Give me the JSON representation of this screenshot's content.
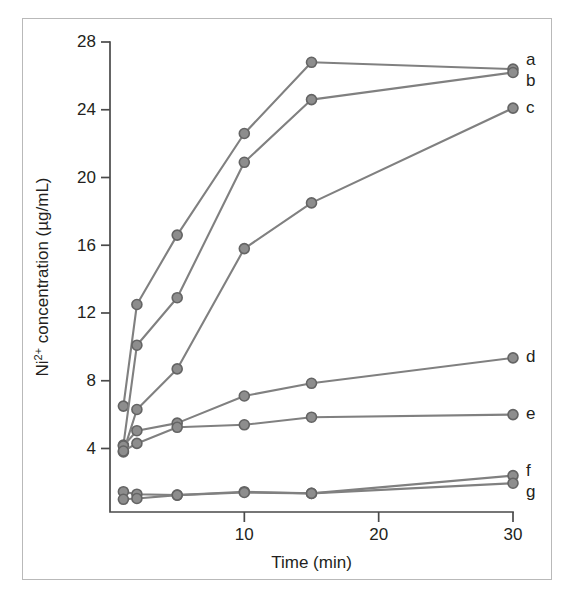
{
  "figure": {
    "background_color": "#ffffff",
    "border_color": "#b9b9b9",
    "axis_color": "#4a4a4a",
    "text_color": "#231f20"
  },
  "chart_data": {
    "type": "line",
    "title": "",
    "subtitle": "",
    "xlabel": "Time (min)",
    "ylabel": "Ni2+ concentration (µg/mL)",
    "ylabel_parts": {
      "prefix": "Ni",
      "superscript": "2+",
      "suffix": " concentration (µg/mL)"
    },
    "xlim": [
      0,
      31.5
    ],
    "ylim": [
      0,
      28.6
    ],
    "xticks": [
      10,
      20,
      30
    ],
    "xtick_labels": [
      "10",
      "20",
      "30"
    ],
    "yticks": [
      4,
      8,
      12,
      16,
      20,
      24,
      28
    ],
    "ytick_labels": [
      "4",
      "8",
      "12",
      "16",
      "20",
      "24",
      "28"
    ],
    "grid": false,
    "legend_position": "right-of-line-ends",
    "series_color": "#808080",
    "marker_fill": "#8d8d8d",
    "marker_edge": "#646464",
    "marker_radius": 5,
    "series": [
      {
        "name": "a",
        "label": "a",
        "color": "#808080",
        "x": [
          1,
          2,
          5,
          10,
          15,
          30
        ],
        "values": [
          6.5,
          12.5,
          16.6,
          22.6,
          26.8,
          26.4
        ]
      },
      {
        "name": "b",
        "label": "b",
        "color": "#808080",
        "x": [
          1,
          2,
          5,
          10,
          15,
          30
        ],
        "values": [
          4.2,
          10.1,
          12.9,
          20.9,
          24.6,
          26.2
        ]
      },
      {
        "name": "c",
        "label": "c",
        "color": "#808080",
        "x": [
          1,
          2,
          5,
          10,
          15,
          30
        ],
        "values": [
          3.8,
          6.3,
          8.7,
          15.8,
          18.5,
          24.1
        ]
      },
      {
        "name": "d",
        "label": "d",
        "color": "#808080",
        "x": [
          1,
          2,
          5,
          10,
          15,
          30
        ],
        "values": [
          4.15,
          5.05,
          5.5,
          7.1,
          7.85,
          9.35
        ]
      },
      {
        "name": "e",
        "label": "e",
        "color": "#808080",
        "x": [
          1,
          2,
          5,
          10,
          15,
          30
        ],
        "values": [
          3.85,
          4.3,
          5.25,
          5.4,
          5.85,
          6.0
        ]
      },
      {
        "name": "f",
        "label": "f",
        "color": "#808080",
        "x": [
          1,
          2,
          5,
          10,
          15,
          30
        ],
        "values": [
          1.45,
          1.3,
          1.25,
          1.45,
          1.35,
          2.4
        ]
      },
      {
        "name": "g",
        "label": "g",
        "color": "#808080",
        "x": [
          1,
          2,
          5,
          10,
          15,
          30
        ],
        "values": [
          1.0,
          1.05,
          1.25,
          1.4,
          1.35,
          1.95
        ]
      }
    ]
  }
}
